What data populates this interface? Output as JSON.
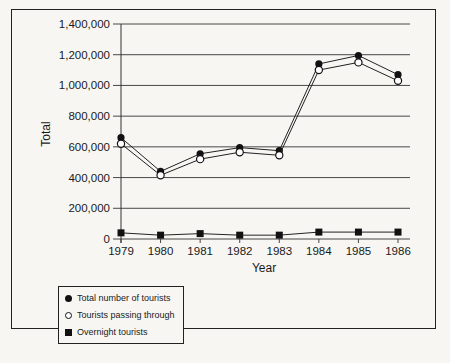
{
  "chart_data": {
    "type": "line",
    "title": "",
    "xlabel": "Year",
    "ylabel": "Total",
    "x": [
      "1979",
      "1980",
      "1981",
      "1982",
      "1983",
      "1984",
      "1985",
      "1986"
    ],
    "ylim": [
      0,
      1400000
    ],
    "yticks": [
      0,
      200000,
      400000,
      600000,
      800000,
      1000000,
      1200000,
      1400000
    ],
    "ytick_labels": [
      "0",
      "200,000",
      "400,000",
      "600,000",
      "800,000",
      "1,000,000",
      "1,200,000",
      "1,400,000"
    ],
    "grid": "horizontal",
    "legend_position": "below-left",
    "series": [
      {
        "name": "Total number of tourists",
        "marker": "filled-circle",
        "values": [
          660000,
          440000,
          555000,
          595000,
          575000,
          1140000,
          1195000,
          1070000
        ]
      },
      {
        "name": "Tourists passing through",
        "marker": "open-circle",
        "values": [
          620000,
          415000,
          520000,
          565000,
          545000,
          1100000,
          1150000,
          1030000
        ]
      },
      {
        "name": "Overnight tourists",
        "marker": "filled-square",
        "values": [
          40000,
          25000,
          35000,
          25000,
          25000,
          45000,
          45000,
          45000
        ]
      }
    ]
  },
  "legend": {
    "items": [
      {
        "label": "Total number of tourists",
        "symbol": "filled-circle"
      },
      {
        "label": "Tourists passing through",
        "symbol": "open-circle"
      },
      {
        "label": "Overnight tourists",
        "symbol": "filled-square"
      }
    ]
  }
}
